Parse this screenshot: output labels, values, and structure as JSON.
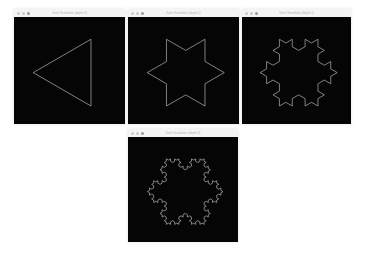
{
  "desktop": {
    "background": "#ffffff"
  },
  "style": {
    "canvas_background": "#050505",
    "stroke_color": "#b4b4b4"
  },
  "windows": [
    {
      "title": "Koch Snowflake (depth 0)",
      "depth": 0,
      "x": 14,
      "y": 9,
      "width": 111,
      "canvas_height": 107
    },
    {
      "title": "Koch Snowflake (depth 1)",
      "depth": 1,
      "x": 128,
      "y": 9,
      "width": 111,
      "canvas_height": 107
    },
    {
      "title": "Koch Snowflake (depth 2)",
      "depth": 2,
      "x": 242,
      "y": 9,
      "width": 109,
      "canvas_height": 107
    },
    {
      "title": "Koch Snowflake (depth 3)",
      "depth": 3,
      "x": 128,
      "y": 129,
      "width": 110,
      "canvas_height": 105
    }
  ],
  "traffic_lights": {
    "close_label": "close",
    "minimize_label": "minimize",
    "zoom_label": "zoom"
  }
}
